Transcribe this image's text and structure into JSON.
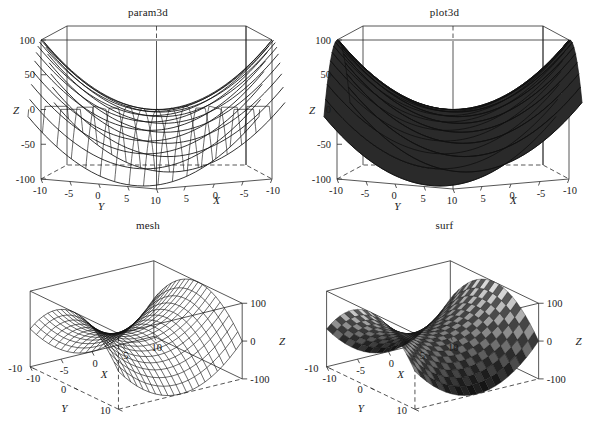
{
  "figure": {
    "background": "#ffffff",
    "line_color": "#111111",
    "text_color": "#1a1a1a",
    "panels": [
      "param3d",
      "plot3d",
      "mesh",
      "surf"
    ]
  },
  "panels": [
    {
      "id": "param3d",
      "title": "param3d",
      "z_label": "Z",
      "z_label_side": "left",
      "z_ticks": [
        "100",
        "50",
        "0",
        "-50",
        "-100"
      ],
      "y_label": "Y",
      "y_ticks": [
        "-10",
        "-5",
        "0",
        "5",
        "10"
      ],
      "x_label": "X",
      "x_ticks": [
        "10",
        "5",
        "0",
        "-5",
        "-10"
      ],
      "style": "wireframe-curves"
    },
    {
      "id": "plot3d",
      "title": "plot3d",
      "z_label": "Z",
      "z_label_side": "left",
      "z_ticks": [
        "100",
        "50",
        "0",
        "-50",
        "-100"
      ],
      "y_label": "Y",
      "y_ticks": [
        "-10",
        "-5",
        "0",
        "5",
        "10"
      ],
      "x_label": "X",
      "x_ticks": [
        "10",
        "5",
        "0",
        "-5",
        "-10"
      ],
      "style": "filled-ribbons"
    },
    {
      "id": "mesh",
      "title": "mesh",
      "z_label": "Z",
      "z_label_side": "right",
      "z_ticks": [
        "100",
        "0",
        "-100"
      ],
      "y_label": "Y",
      "y_ticks": [
        "10",
        "0",
        "-10"
      ],
      "x_label": "X",
      "x_ticks": [
        "-10",
        "-5",
        "0",
        "5",
        "10"
      ],
      "style": "mesh-grid"
    },
    {
      "id": "surf",
      "title": "surf",
      "z_label": "Z",
      "z_label_side": "right",
      "z_ticks": [
        "100",
        "0",
        "-100"
      ],
      "y_label": "Y",
      "y_ticks": [
        "10",
        "0",
        "-10"
      ],
      "x_label": "X",
      "x_ticks": [
        "-10",
        "-5",
        "0",
        "5",
        "10"
      ],
      "style": "shaded-faces"
    }
  ],
  "chart_data": {
    "type": "surface",
    "function": "z = x^2 - y^2",
    "xlabel": "X",
    "ylabel": "Y",
    "zlabel": "Z",
    "xlim": [
      -10,
      10
    ],
    "ylim": [
      -10,
      10
    ],
    "zlim": [
      -100,
      100
    ],
    "x_ticks": [
      -10,
      -5,
      0,
      5,
      10
    ],
    "y_ticks": [
      -10,
      -5,
      0,
      5,
      10
    ],
    "z_ticks": [
      -100,
      -50,
      0,
      50,
      100
    ],
    "grid": true,
    "legend": "none",
    "colormap": "gray",
    "samples": 21,
    "series": [
      {
        "name": "param3d",
        "render": "curves",
        "values": "z = x^2 - y^2 over [-10,10]^2"
      },
      {
        "name": "plot3d",
        "render": "filled",
        "values": "z = x^2 - y^2 over [-10,10]^2"
      },
      {
        "name": "mesh",
        "render": "wireframe",
        "values": "z = x^2 - y^2 over [-10,10]^2"
      },
      {
        "name": "surf",
        "render": "shaded",
        "values": "z = x^2 - y^2 over [-10,10]^2"
      }
    ]
  }
}
